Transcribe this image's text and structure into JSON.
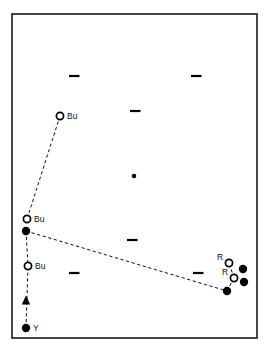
{
  "figure": {
    "name": "scatter-map-panel",
    "background_color": "#ffffff",
    "border_color": "#1a1a1a",
    "frame": {
      "x": 12,
      "y": 14,
      "width": 245,
      "height": 324
    }
  },
  "chart_data": {
    "type": "scatter",
    "title": "",
    "subtitle": "",
    "xlabel": "",
    "ylabel": "",
    "grid": false,
    "legend_position": "none",
    "xlim": [
      12,
      257
    ],
    "ylim": [
      14,
      338
    ],
    "axis_note": "pixel coordinates within plot frame; y increases downward",
    "series": [
      {
        "name": "open-circle-labeled",
        "marker": "open-circle",
        "color": "#000000",
        "points": [
          {
            "id": "bu-top",
            "label": "Bu",
            "x": 60,
            "y": 116,
            "label_dx": 7,
            "label_dy": 3
          },
          {
            "id": "bu-mid",
            "label": "Bu",
            "x": 27,
            "y": 219,
            "label_dx": 7,
            "label_dy": 3
          },
          {
            "id": "bu-lower",
            "label": "Bu",
            "x": 28,
            "y": 266,
            "label_dx": 7,
            "label_dy": 3
          },
          {
            "id": "r-upper",
            "label": "R",
            "x": 229,
            "y": 263,
            "label_dx": -12,
            "label_dy": -3
          },
          {
            "id": "r-lower",
            "label": "R",
            "x": 234,
            "y": 278,
            "label_dx": -12,
            "label_dy": -3
          }
        ]
      },
      {
        "name": "filled-circle-labeled",
        "marker": "filled-circle",
        "color": "#000000",
        "points": [
          {
            "id": "y-bottom",
            "label": "Y",
            "x": 26,
            "y": 328,
            "label_dx": 7,
            "label_dy": 3
          }
        ]
      },
      {
        "name": "filled-circle-unlabeled",
        "marker": "filled-circle",
        "color": "#000000",
        "points": [
          {
            "id": "f-mid-left",
            "label": "",
            "x": 26,
            "y": 231
          },
          {
            "id": "f-right-upper",
            "label": "",
            "x": 243,
            "y": 269
          },
          {
            "id": "f-right-lower",
            "label": "",
            "x": 244,
            "y": 282
          },
          {
            "id": "f-bottom-right",
            "label": "",
            "x": 227,
            "y": 291
          }
        ]
      },
      {
        "name": "center-small-dot",
        "marker": "small-filled-dot",
        "color": "#000000",
        "points": [
          {
            "id": "center-dot",
            "label": "",
            "x": 134,
            "y": 176
          }
        ]
      },
      {
        "name": "dash-ticks",
        "marker": "horizontal-dash",
        "color": "#000000",
        "points": [
          {
            "id": "dash-1",
            "label": "",
            "x": 74,
            "y": 76
          },
          {
            "id": "dash-2",
            "label": "",
            "x": 196,
            "y": 76
          },
          {
            "id": "dash-3",
            "label": "",
            "x": 135,
            "y": 111
          },
          {
            "id": "dash-4",
            "label": "",
            "x": 132,
            "y": 240
          },
          {
            "id": "dash-5",
            "label": "",
            "x": 74,
            "y": 273
          },
          {
            "id": "dash-6",
            "label": "",
            "x": 198,
            "y": 273
          }
        ]
      }
    ],
    "connectors": [
      {
        "id": "conn-bu-top-to-mid",
        "from": "bu-top",
        "to": "bu-mid",
        "style": "dashed",
        "arrow": false
      },
      {
        "id": "conn-mid-to-bottom-right",
        "from": "f-mid-left",
        "to": "f-bottom-right",
        "style": "dashed",
        "arrow": false
      },
      {
        "id": "conn-bottom-right-to-r-lower",
        "from": "f-bottom-right",
        "to": "r-lower",
        "style": "dashed",
        "arrow": false
      },
      {
        "id": "conn-r-lower-to-r-upper",
        "from": "r-lower",
        "to": "r-upper",
        "style": "dashed",
        "arrow": false
      },
      {
        "id": "conn-mid-to-bu-lower",
        "from": "f-mid-left",
        "to": "bu-lower",
        "style": "dashed",
        "arrow": false
      },
      {
        "id": "conn-y-to-bu-lower",
        "from": "y-bottom",
        "to": "bu-lower",
        "style": "dashed",
        "arrow": true
      }
    ],
    "arrowheads": [
      {
        "id": "arrow-up-left",
        "x": 26,
        "y": 300,
        "direction": "up"
      }
    ]
  }
}
